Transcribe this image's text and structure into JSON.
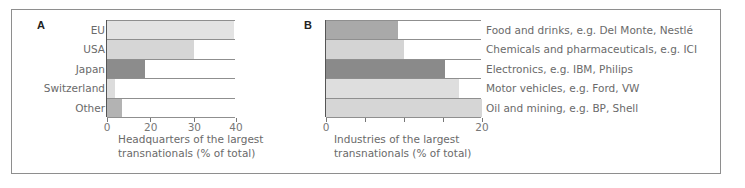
{
  "chart_data": [
    {
      "panel": "A",
      "type": "bar",
      "orientation": "horizontal",
      "categories": [
        "EU",
        "USA",
        "Japan",
        "Switzerland",
        "Other"
      ],
      "values": [
        39.5,
        30,
        18.5,
        1.5,
        3.5
      ],
      "bar_fraction": [
        0.984,
        0.678,
        0.291,
        0.063,
        0.118
      ],
      "colors": [
        "#e3e3e3",
        "#d6d6d6",
        "#8c8c8c",
        "#dcdcdc",
        "#b3b3b3"
      ],
      "xlabel_lines": [
        "Headquarters of the largest",
        "transnationals (% of total)"
      ],
      "ylabel": "",
      "ticks": [
        {
          "label": "0",
          "pos": 0
        },
        {
          "label": "20",
          "pos": 0.339
        },
        {
          "label": "30",
          "pos": 0.677
        },
        {
          "label": "40",
          "pos": 1.0
        }
      ],
      "xlim": [
        0,
        40
      ],
      "grid": false,
      "legend": "none"
    },
    {
      "panel": "B",
      "type": "bar",
      "orientation": "horizontal",
      "categories": [
        "Food and drinks, e.g. Del Monte, Nestlé",
        "Chemicals and pharmaceuticals, e.g. ICI",
        "Electronics, e.g. IBM, Philips",
        "Motor vehicles, e.g. Ford, VW",
        "Oil and mining, e.g. BP, Shell"
      ],
      "values": [
        9.2,
        10,
        15.2,
        17.1,
        20
      ],
      "bar_fraction": [
        0.46,
        0.5,
        0.76,
        0.855,
        1.0
      ],
      "colors": [
        "#a9a9a9",
        "#d4d4d4",
        "#8a8a8a",
        "#dedede",
        "#d6d6d6"
      ],
      "xlabel_lines": [
        "Industries of the largest",
        "transnationals (% of total)"
      ],
      "ylabel": "",
      "ticks": [
        {
          "label": "0",
          "pos": 0
        },
        {
          "label": "",
          "pos": 0.25
        },
        {
          "label": "",
          "pos": 0.5
        },
        {
          "label": "",
          "pos": 0.75
        },
        {
          "label": "20",
          "pos": 1.0
        }
      ],
      "xlim": [
        0,
        20
      ],
      "grid": false,
      "legend": "none"
    }
  ]
}
